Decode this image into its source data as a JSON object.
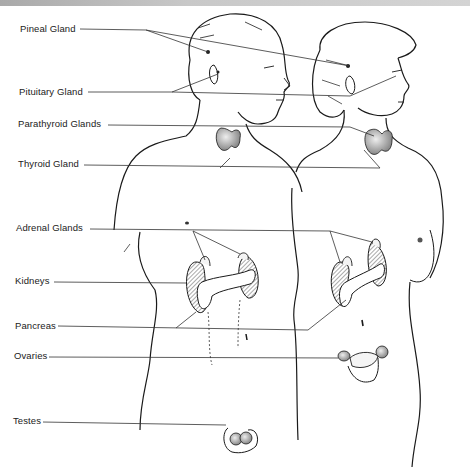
{
  "diagram": {
    "labels": [
      {
        "id": "pineal",
        "text": "Pineal Gland"
      },
      {
        "id": "pituitary",
        "text": "Pituitary Gland"
      },
      {
        "id": "parathyroid",
        "text": "Parathyroid Glands"
      },
      {
        "id": "thyroid",
        "text": "Thyroid Gland"
      },
      {
        "id": "adrenal",
        "text": "Adrenal Glands"
      },
      {
        "id": "kidneys",
        "text": "Kidneys"
      },
      {
        "id": "pancreas",
        "text": "Pancreas"
      },
      {
        "id": "ovaries",
        "text": "Ovaries"
      },
      {
        "id": "testes",
        "text": "Testes"
      }
    ],
    "figures": [
      "male-figure",
      "female-figure"
    ],
    "colors": {
      "line": "#222222",
      "shade": "#9a9a9a",
      "background": "#ffffff",
      "topbar": "#bdbdbd"
    }
  }
}
